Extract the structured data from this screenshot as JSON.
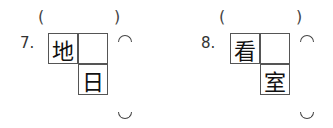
{
  "questions": [
    {
      "number": "7.",
      "open_paren": "(",
      "close_paren": ")",
      "cells": {
        "top_left": "地",
        "top_right": "",
        "bottom_right": "日"
      }
    },
    {
      "number": "8.",
      "open_paren": "(",
      "close_paren": ")",
      "cells": {
        "top_left": "看",
        "top_right": "",
        "bottom_right": "室"
      }
    }
  ]
}
